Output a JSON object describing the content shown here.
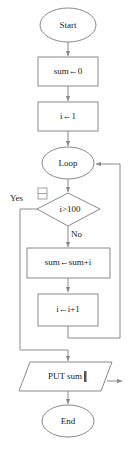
{
  "diagram": {
    "colors": {
      "stroke": "#8a8a8a",
      "text": "#1a1a1a",
      "background": "#ffffff"
    },
    "nodes": {
      "start": {
        "label": "Start",
        "shape": "ellipse"
      },
      "init_sum": {
        "label": "sum←0",
        "shape": "process"
      },
      "init_i": {
        "label": "i←1",
        "shape": "process"
      },
      "loop": {
        "label": "Loop",
        "shape": "ellipse"
      },
      "condition": {
        "label": "i>100",
        "shape": "decision"
      },
      "accumulate": {
        "label": "sum←sum+i",
        "shape": "process"
      },
      "increment": {
        "label": "i←i+1",
        "shape": "process"
      },
      "output": {
        "label": "PUT sum",
        "shape": "parallelogram"
      },
      "end": {
        "label": "End",
        "shape": "ellipse"
      }
    },
    "edge_labels": {
      "yes": "Yes",
      "no": "No"
    }
  }
}
